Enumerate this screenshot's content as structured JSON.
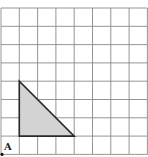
{
  "diagram": {
    "type": "grid-with-triangle",
    "grid": {
      "columns": 8,
      "rows": 8,
      "origin_px": [
        1,
        8
      ],
      "cell_px": 18.3,
      "line_color": "#8a8a8a"
    },
    "triangle": {
      "vertices_grid": [
        [
          1,
          4
        ],
        [
          1,
          1
        ],
        [
          4,
          1
        ]
      ],
      "fill": "#d3d3d3",
      "stroke": "#2a2a2a"
    },
    "point": {
      "label": "A",
      "grid_position": [
        0,
        0
      ],
      "color": "#111111"
    }
  }
}
